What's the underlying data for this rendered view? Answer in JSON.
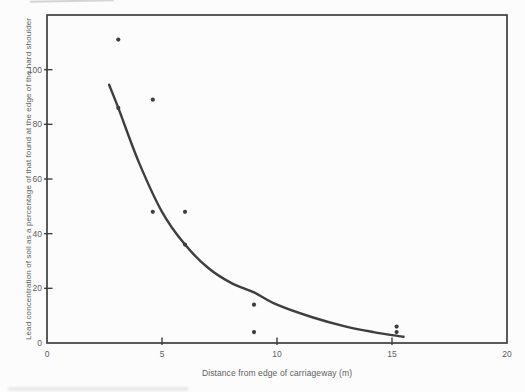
{
  "figure": {
    "background_color": "#fcfcfc",
    "ink_color": "#3e3e3e",
    "text_color": "#5e5e5e"
  },
  "chart_data": {
    "type": "scatter",
    "title": "",
    "xlabel": "Distance from edge of carriageway (m)",
    "ylabel": "Lead concentration of soil as a percentage of that found at the edge of the hard shoulder",
    "xlim": [
      0,
      20
    ],
    "ylim": [
      0,
      120
    ],
    "xticks": [
      0,
      5,
      10,
      15,
      20
    ],
    "yticks": [
      0,
      20,
      40,
      60,
      80,
      100
    ],
    "grid": false,
    "legend": null,
    "marker": "dot",
    "point_radius": 2.1,
    "points": [
      {
        "x": 3.1,
        "y": 111
      },
      {
        "x": 3.1,
        "y": 86
      },
      {
        "x": 4.6,
        "y": 89
      },
      {
        "x": 4.6,
        "y": 48
      },
      {
        "x": 6.0,
        "y": 48
      },
      {
        "x": 6.0,
        "y": 36
      },
      {
        "x": 9.0,
        "y": 14
      },
      {
        "x": 9.0,
        "y": 4
      },
      {
        "x": 15.2,
        "y": 6
      },
      {
        "x": 15.2,
        "y": 4
      }
    ],
    "fitted_curve": [
      {
        "x": 2.7,
        "y": 94.5
      },
      {
        "x": 3.1,
        "y": 86
      },
      {
        "x": 4.0,
        "y": 66
      },
      {
        "x": 5.0,
        "y": 48
      },
      {
        "x": 6.0,
        "y": 36
      },
      {
        "x": 7.0,
        "y": 27.5
      },
      {
        "x": 8.0,
        "y": 22
      },
      {
        "x": 9.0,
        "y": 18.5
      },
      {
        "x": 10.0,
        "y": 14
      },
      {
        "x": 11.5,
        "y": 9.5
      },
      {
        "x": 13.0,
        "y": 6
      },
      {
        "x": 14.2,
        "y": 4
      },
      {
        "x": 15.5,
        "y": 2.3
      }
    ],
    "curve_style": "solid"
  }
}
